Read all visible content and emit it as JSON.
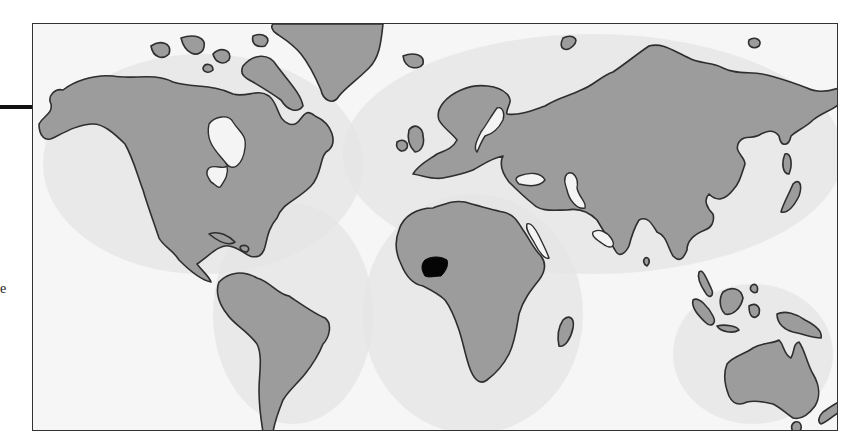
{
  "figure": {
    "type": "world-map",
    "highlighted_region": "Nigeria",
    "colors": {
      "land": "#9c9c9c",
      "ocean": "#f6f6f6",
      "coastline": "#2e2e2e",
      "highlight": "#050505",
      "frame": "#333333"
    }
  },
  "page": {
    "leader_line": true,
    "cut_text_fragment": "e"
  }
}
